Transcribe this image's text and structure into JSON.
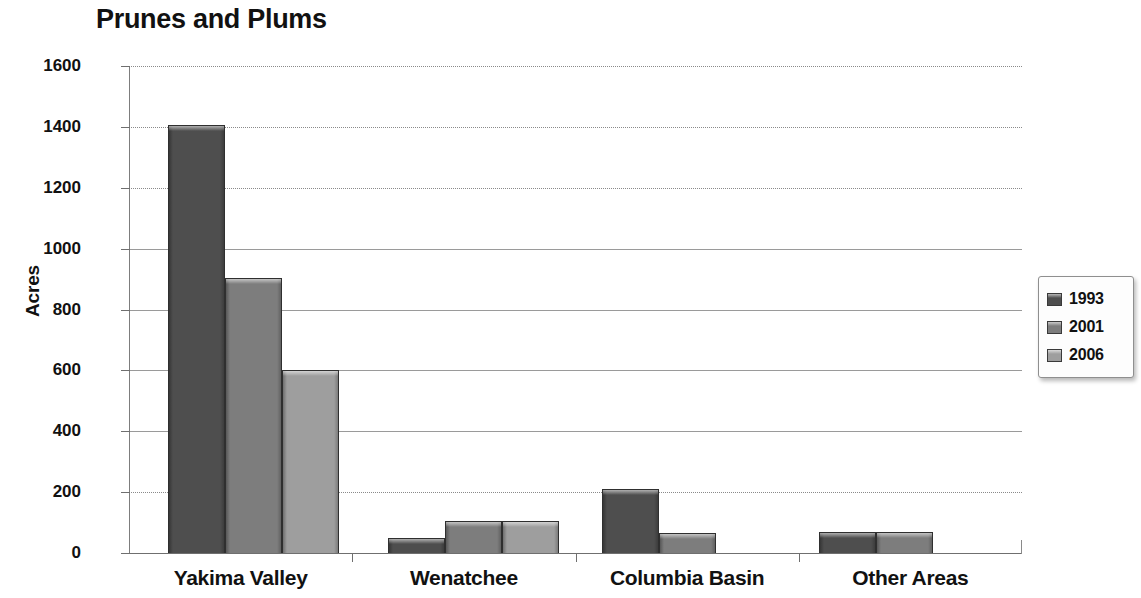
{
  "chart_data": {
    "type": "bar",
    "title": "Prunes and Plums",
    "xlabel": "",
    "ylabel": "Acres",
    "ylim": [
      0,
      1600
    ],
    "yticks": [
      0,
      200,
      400,
      600,
      800,
      1000,
      1200,
      1400,
      1600
    ],
    "ytick_labels": [
      "0",
      "200",
      "400",
      "600",
      "800",
      "1000",
      "1200",
      "1400",
      "1600"
    ],
    "grid": true,
    "grid_axis": "y",
    "legend_position": "right",
    "categories": [
      "Yakima Valley",
      "Wenatchee",
      "Columbia Basin",
      "Other Areas"
    ],
    "series": [
      {
        "name": "1993",
        "color": "#4e4e4e",
        "values": [
          1405,
          50,
          210,
          70
        ]
      },
      {
        "name": "2001",
        "color": "#7d7d7d",
        "values": [
          905,
          105,
          65,
          70
        ]
      },
      {
        "name": "2006",
        "color": "#9e9e9e",
        "values": [
          600,
          105,
          0,
          0
        ]
      }
    ]
  },
  "legend": {
    "entries": [
      {
        "label": "1993",
        "color": "#4e4e4e"
      },
      {
        "label": "2001",
        "color": "#7d7d7d"
      },
      {
        "label": "2006",
        "color": "#9e9e9e"
      }
    ]
  }
}
